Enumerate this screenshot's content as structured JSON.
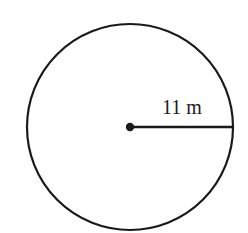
{
  "figure": {
    "type": "circle",
    "center": {
      "x": 130,
      "y": 127
    },
    "radius_px": 103,
    "stroke_color": "#1a1a1a",
    "radius_label": "11 m",
    "radius_value": 11,
    "radius_unit": "m"
  }
}
